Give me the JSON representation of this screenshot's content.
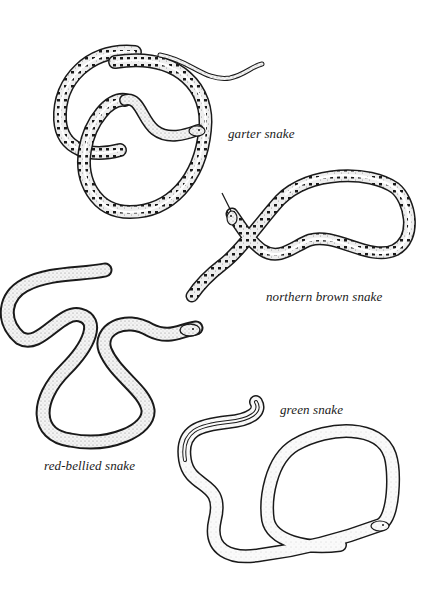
{
  "plate": {
    "background": "#ffffff",
    "ink": "#1a1a1a",
    "snakes": [
      {
        "id": "garter",
        "label": "garter snake",
        "pattern": "dorsal stripes with dark spots"
      },
      {
        "id": "northern-brown",
        "label": "northern brown snake",
        "pattern": "stippled with dark spots and pale stripe"
      },
      {
        "id": "red-bellied",
        "label": "red-bellied snake",
        "pattern": "stippled with dark edges"
      },
      {
        "id": "green",
        "label": "green snake",
        "pattern": "lightly stippled, plain"
      }
    ]
  }
}
